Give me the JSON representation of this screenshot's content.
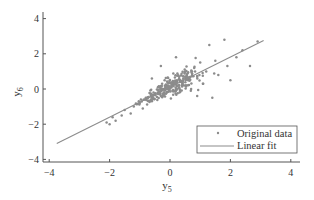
{
  "chart_data": {
    "type": "scatter",
    "title": "",
    "xlabel": "y",
    "xlabel_sub": "5",
    "ylabel": "y",
    "ylabel_sub": "6",
    "xlim": [
      -4,
      4
    ],
    "ylim": [
      -4,
      4
    ],
    "xticks": [
      -4,
      -2,
      0,
      2,
      4
    ],
    "yticks": [
      -4,
      -2,
      0,
      2,
      4
    ],
    "xtick_labels": [
      "−4",
      "−2",
      "0",
      "2",
      "4"
    ],
    "ytick_labels": [
      "−4",
      "−2",
      "0",
      "2",
      "4"
    ],
    "grid": false,
    "legend_position": "lower right",
    "series": [
      {
        "name": "Original data",
        "kind": "scatter",
        "color": "#8c8c8c",
        "marker": "dot",
        "n_points_approx": 300,
        "x_range": [
          -2.2,
          3.0
        ],
        "y_range": [
          -2.1,
          2.9
        ],
        "note": "cloud of points around y6 ≈ 0.85·y5, densest near (0, 0)",
        "sample_points": [
          [
            -2.1,
            -1.9
          ],
          [
            -2.0,
            -2.0
          ],
          [
            -1.9,
            -1.6
          ],
          [
            -1.8,
            -1.8
          ],
          [
            -1.6,
            -1.5
          ],
          [
            -1.5,
            -1.2
          ],
          [
            -1.3,
            -1.4
          ],
          [
            -1.2,
            -1.0
          ],
          [
            -1.0,
            -0.8
          ],
          [
            -0.9,
            -1.1
          ],
          [
            -0.8,
            -0.5
          ],
          [
            -0.6,
            -0.7
          ],
          [
            -0.5,
            -0.3
          ],
          [
            -0.4,
            0.1
          ],
          [
            -0.3,
            -0.4
          ],
          [
            -0.2,
            0.0
          ],
          [
            -0.1,
            -0.2
          ],
          [
            0.0,
            0.1
          ],
          [
            0.1,
            0.4
          ],
          [
            0.2,
            -0.1
          ],
          [
            0.3,
            0.6
          ],
          [
            0.4,
            0.2
          ],
          [
            0.5,
            1.0
          ],
          [
            0.6,
            0.5
          ],
          [
            0.7,
            0.0
          ],
          [
            0.8,
            1.2
          ],
          [
            0.9,
            0.7
          ],
          [
            1.0,
            1.5
          ],
          [
            1.1,
            0.3
          ],
          [
            1.2,
            1.0
          ],
          [
            1.3,
            2.5
          ],
          [
            1.4,
            -0.5
          ],
          [
            1.5,
            1.6
          ],
          [
            1.6,
            0.8
          ],
          [
            1.8,
            2.8
          ],
          [
            1.9,
            1.3
          ],
          [
            2.0,
            0.5
          ],
          [
            2.2,
            1.8
          ],
          [
            2.4,
            2.2
          ],
          [
            2.65,
            1.3
          ],
          [
            2.9,
            2.7
          ],
          [
            -0.3,
            1.3
          ],
          [
            0.2,
            1.8
          ],
          [
            -0.6,
            0.6
          ],
          [
            0.9,
            -0.4
          ]
        ]
      },
      {
        "name": "Linear fit",
        "kind": "line",
        "color": "#8c8c8c",
        "slope": 0.85,
        "intercept": 0.1,
        "x": [
          -3.75,
          3.1
        ],
        "y": [
          -3.1,
          2.75
        ]
      }
    ],
    "legend": [
      {
        "label": "Original data",
        "marker": "dot"
      },
      {
        "label": "Linear fit",
        "marker": "line"
      }
    ]
  }
}
